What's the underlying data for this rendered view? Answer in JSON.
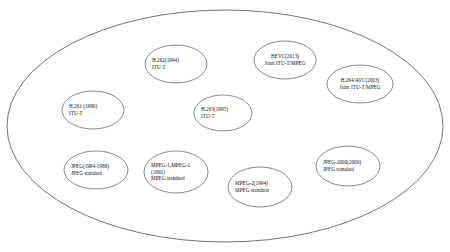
{
  "diagram": {
    "type": "venn-grouping",
    "container": {
      "name": "outer-boundary-ellipse",
      "cx": 225,
      "cy": 126,
      "rx": 218,
      "ry": 116,
      "stroke": "#3a3a3a",
      "fill": "#ffffff"
    },
    "stroke_color": "#3a3a3a",
    "fill_color": "#ffffff",
    "text_color": "#111111",
    "nodes": [
      {
        "id": "h262",
        "name": "h262-node",
        "cx": 176,
        "cy": 64,
        "rx": 31,
        "ry": 19,
        "lines": [
          "H.262(1994)",
          "ITU-T"
        ],
        "align": "left"
      },
      {
        "id": "hevc",
        "name": "hevc-node",
        "cx": 285,
        "cy": 60,
        "rx": 31,
        "ry": 19,
        "lines": [
          "HEVC(2013)",
          "Joint ITU-T/MPEG"
        ],
        "align": "center"
      },
      {
        "id": "h264avc",
        "name": "h264-avc-node",
        "cx": 360,
        "cy": 84,
        "rx": 33,
        "ry": 19,
        "lines": [
          "H.264/AVC(2003)",
          "Joint ITU-T/MPEG"
        ],
        "align": "center"
      },
      {
        "id": "h261",
        "name": "h261-node",
        "cx": 93,
        "cy": 110,
        "rx": 31,
        "ry": 19,
        "lines": [
          "H.261 (1990)",
          "ITU-T"
        ],
        "align": "left"
      },
      {
        "id": "h263",
        "name": "h263-node",
        "cx": 223,
        "cy": 113,
        "rx": 29,
        "ry": 18,
        "lines": [
          "H.263(1995)",
          "ITU-T"
        ],
        "align": "left"
      },
      {
        "id": "jpeg",
        "name": "jpeg-node",
        "cx": 96,
        "cy": 170,
        "rx": 32,
        "ry": 19,
        "lines": [
          "JPEG(1984-1988)",
          "JPEG  standard"
        ],
        "align": "left"
      },
      {
        "id": "mpeg12",
        "name": "mpeg1-mpeg2-node",
        "cx": 176,
        "cy": 172,
        "rx": 32,
        "ry": 21,
        "lines": [
          "MPEG-1,MPEG-2",
          "(1992)",
          "MPEG standard"
        ],
        "align": "left"
      },
      {
        "id": "mpeg2",
        "name": "mpeg2-node",
        "cx": 260,
        "cy": 187,
        "rx": 32,
        "ry": 20,
        "lines": [
          "MPEG-2(1994)",
          "MPEG standard"
        ],
        "align": "left"
      },
      {
        "id": "jpeg2000",
        "name": "jpeg-2000-node",
        "cx": 348,
        "cy": 166,
        "rx": 32,
        "ry": 20,
        "lines": [
          "JPEG-2000(2000)",
          "JPEG standard"
        ],
        "align": "left"
      }
    ]
  }
}
